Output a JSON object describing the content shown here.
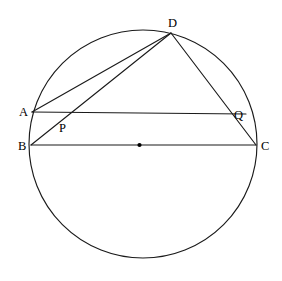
{
  "diagram": {
    "type": "euclidean-geometry",
    "canvas": {
      "width": 282,
      "height": 281
    },
    "colors": {
      "stroke": "#1a1a1a",
      "label": "#000000",
      "background": "#ffffff"
    },
    "circle": {
      "name": "main-circle",
      "cx": 143,
      "cy": 144,
      "r": 114
    },
    "center": {
      "name": "circle-center",
      "cx": 139.5,
      "cy": 145,
      "r": 2.1,
      "label": ""
    },
    "points": [
      {
        "id": "A",
        "label": "A",
        "x": 32,
        "y": 112,
        "lx": 19,
        "ly": 116
      },
      {
        "id": "B",
        "label": "B",
        "x": 31,
        "y": 145,
        "lx": 18,
        "ly": 150
      },
      {
        "id": "C",
        "label": "C",
        "x": 256,
        "y": 145,
        "lx": 261,
        "ly": 150
      },
      {
        "id": "D",
        "label": "D",
        "x": 171,
        "y": 33,
        "lx": 168,
        "ly": 27
      },
      {
        "id": "P",
        "label": "P",
        "x": 66,
        "y": 117,
        "lx": 59,
        "ly": 132
      },
      {
        "id": "Q",
        "label": "Q",
        "x": 246,
        "y": 114,
        "lx": 234,
        "ly": 119
      }
    ],
    "segments": [
      {
        "name": "segment-AD",
        "from": "A",
        "to": "D",
        "x1": 32,
        "y1": 112,
        "x2": 171,
        "y2": 33
      },
      {
        "name": "segment-AQ",
        "from": "A",
        "to": "Q",
        "x1": 32,
        "y1": 112,
        "x2": 246,
        "y2": 114
      },
      {
        "name": "segment-BD",
        "from": "B",
        "to": "D",
        "x1": 31,
        "y1": 145,
        "x2": 171,
        "y2": 33
      },
      {
        "name": "segment-BC",
        "from": "B",
        "to": "C",
        "x1": 31,
        "y1": 145,
        "x2": 256,
        "y2": 145
      },
      {
        "name": "segment-DC",
        "from": "D",
        "to": "C",
        "x1": 171,
        "y1": 33,
        "x2": 256,
        "y2": 145
      }
    ],
    "intersections": [
      {
        "name": "intersection-P",
        "label": "P",
        "of": [
          "segment-AQ",
          "segment-BD"
        ]
      },
      {
        "name": "intersection-Q",
        "label": "Q",
        "of": [
          "segment-AQ",
          "segment-DC"
        ]
      }
    ]
  }
}
